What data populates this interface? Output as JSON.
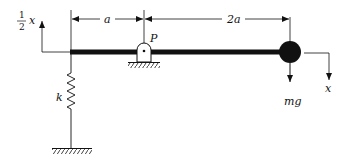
{
  "diagram": {
    "type": "mechanical-system",
    "labels": {
      "left_displacement_num": "1",
      "left_displacement_den": "2",
      "left_displacement_var": "x",
      "dim_left": "a",
      "dim_right": "2a",
      "pivot": "P",
      "spring": "k",
      "weight": "mg",
      "right_displacement": "x"
    },
    "colors": {
      "ink": "#111111",
      "background": "#ffffff"
    }
  }
}
